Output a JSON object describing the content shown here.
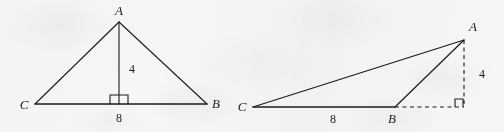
{
  "figure": {
    "background_color": "#f6f6f4",
    "ink_color": "#1b1b1b",
    "left_triangle": {
      "vertex_labels": {
        "apex": "A",
        "left": "C",
        "right": "B"
      },
      "altitude_label": "4",
      "base_label": "8",
      "right_angle_marker": "right-angle-square",
      "geometry": {
        "apex": [
          119,
          22
        ],
        "left": [
          35,
          104
        ],
        "right": [
          207,
          104
        ],
        "foot": [
          119,
          104
        ]
      }
    },
    "right_triangle": {
      "vertex_labels": {
        "apex": "A",
        "left": "C",
        "right": "B"
      },
      "height_label": "4",
      "base_label": "8",
      "right_angle_marker": "right-angle-square",
      "geometry": {
        "apex": [
          464,
          40
        ],
        "left": [
          253,
          107
        ],
        "right": [
          395,
          107
        ],
        "foot": [
          464,
          107
        ]
      }
    }
  }
}
